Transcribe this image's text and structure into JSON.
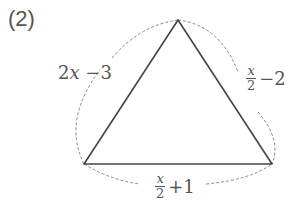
{
  "problem_number": "(2)",
  "triangle": {
    "vertices": {
      "top": [
        178,
        20
      ],
      "bottom_left": [
        84,
        164
      ],
      "bottom_right": [
        272,
        164
      ]
    },
    "line_color": "#444444",
    "dash_color": "#888888"
  },
  "sides": {
    "left": {
      "coef": "2",
      "var": "x",
      "rest": " −3"
    },
    "right": {
      "num": "x",
      "den": "2",
      "rest": "−2"
    },
    "bottom": {
      "num": "x",
      "den": "2",
      "rest": "+1"
    }
  }
}
